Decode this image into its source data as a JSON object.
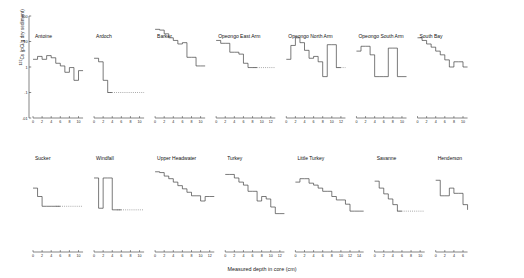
{
  "figure": {
    "xlabel": "Measured depth in core (cm)",
    "ylabel_prefix": "137",
    "ylabel_main": "Cs (pCi/g dry sediment)"
  },
  "chart_data": {
    "type": "line",
    "title": "",
    "xlabel": "Measured depth in core (cm)",
    "ylabel": "137Cs (pCi/g dry sediment)",
    "yscale": "log",
    "ylim": [
      0.01,
      100
    ],
    "yticks": [
      0.01,
      0.1,
      1,
      10,
      100
    ],
    "ytick_labels": [
      ".01",
      ".1",
      "1",
      "10",
      "100"
    ],
    "grid": false,
    "legend": "none",
    "line_style": "step-post",
    "dotted_means": "below detection limit",
    "panels": [
      {
        "name": "Antoine",
        "row": 0,
        "xlim": [
          0,
          11
        ],
        "xticks": [
          0,
          2,
          4,
          6,
          8,
          10
        ],
        "x": [
          0,
          1,
          2,
          3,
          4,
          5,
          6,
          7,
          8,
          9,
          10,
          11
        ],
        "y": [
          2.0,
          2.6,
          2.0,
          2.8,
          2.3,
          1.4,
          1.1,
          0.62,
          0.95,
          0.3,
          0.72,
          0.72
        ],
        "dotted_from": null
      },
      {
        "name": "Ardoch",
        "row": 0,
        "xlim": [
          0,
          11
        ],
        "xticks": [
          0,
          2,
          4,
          6,
          8,
          10
        ],
        "x": [
          0,
          1,
          2,
          3,
          4,
          5,
          6,
          7,
          8,
          9,
          10,
          11
        ],
        "y": [
          2.2,
          1.6,
          0.3,
          0.1,
          0.1,
          0.1,
          0.1,
          0.1,
          0.1,
          0.1,
          0.1,
          0.1
        ],
        "dotted_from": 3
      },
      {
        "name": "Barker",
        "row": 0,
        "xlim": [
          0,
          11
        ],
        "xticks": [
          0,
          2,
          4,
          6,
          8,
          10
        ],
        "x": [
          0,
          1,
          2,
          3,
          4,
          5,
          6,
          7,
          8,
          9,
          10
        ],
        "y": [
          30,
          28,
          20,
          14,
          11,
          8.0,
          9.0,
          2.4,
          2.4,
          1.1,
          1.1
        ],
        "dotted_from": null
      },
      {
        "name": "Opeongo East Arm",
        "row": 0,
        "xlim": [
          0,
          13
        ],
        "xticks": [
          0,
          2,
          4,
          6,
          8,
          10,
          12
        ],
        "x": [
          0,
          1,
          2,
          3,
          4,
          5,
          6,
          7,
          8,
          9,
          10,
          11,
          12
        ],
        "y": [
          11,
          8.5,
          8.5,
          3.8,
          3.8,
          3.2,
          1.4,
          0.95,
          0.95,
          0.95,
          0.95,
          0.95,
          0.95
        ],
        "dotted_from": 8
      },
      {
        "name": "Opeongo North Arm",
        "row": 0,
        "xlim": [
          0,
          13
        ],
        "xticks": [
          0,
          2,
          4,
          6,
          8,
          10,
          12
        ],
        "x": [
          0,
          1,
          2,
          3,
          4,
          5,
          6,
          7,
          8,
          9,
          10,
          11,
          12
        ],
        "y": [
          2.0,
          7.0,
          14,
          9.0,
          4.5,
          2.2,
          2.6,
          1.6,
          0.42,
          7.5,
          7.5,
          0.95,
          0.95
        ],
        "dotted_from": 11
      },
      {
        "name": "Opeongo South Arm",
        "row": 0,
        "xlim": [
          0,
          11
        ],
        "xticks": [
          0,
          2,
          4,
          6,
          8,
          10
        ],
        "x": [
          0,
          1,
          2,
          3,
          4,
          5,
          6,
          7,
          8,
          9,
          10
        ],
        "y": [
          4.2,
          6.5,
          6.5,
          3.0,
          0.42,
          0.42,
          0.42,
          5.5,
          5.5,
          0.42,
          0.42
        ],
        "dotted_from": null
      },
      {
        "name": "South Bay",
        "row": 0,
        "xlim": [
          0,
          11
        ],
        "xticks": [
          0,
          2,
          4,
          6,
          8,
          10
        ],
        "x": [
          0,
          1,
          2,
          3,
          4,
          5,
          6,
          7,
          8,
          9,
          10
        ],
        "y": [
          14,
          11,
          8.0,
          6.0,
          4.2,
          3.0,
          1.9,
          1.0,
          1.6,
          1.6,
          1.0
        ],
        "dotted_from": null
      },
      {
        "name": "Sucker",
        "row": 1,
        "xlim": [
          0,
          11
        ],
        "xticks": [
          0,
          2,
          4,
          6,
          8,
          10
        ],
        "x": [
          0,
          1,
          2,
          3,
          4,
          5,
          6,
          7,
          8,
          9,
          10
        ],
        "y": [
          3.2,
          1.5,
          0.62,
          0.62,
          0.62,
          0.62,
          0.62,
          0.62,
          0.62,
          0.62,
          0.62
        ],
        "dotted_from": 5
      },
      {
        "name": "Windfall",
        "row": 1,
        "xlim": [
          0,
          11
        ],
        "xticks": [
          0,
          2,
          4,
          6,
          8,
          10
        ],
        "x": [
          0,
          1,
          2,
          3,
          4,
          5,
          6,
          7,
          8,
          9,
          10
        ],
        "y": [
          8.0,
          0.52,
          8.0,
          8.0,
          0.45,
          0.45,
          0.45,
          0.45,
          0.45,
          0.45,
          0.45
        ],
        "dotted_from": 5
      },
      {
        "name": "Upper Headwater",
        "row": 1,
        "xlim": [
          0,
          13
        ],
        "xticks": [
          0,
          2,
          4,
          6,
          8,
          10,
          12
        ],
        "x": [
          0,
          1,
          2,
          3,
          4,
          5,
          6,
          7,
          8,
          9,
          10,
          11,
          12
        ],
        "y": [
          14,
          13,
          9.5,
          7.5,
          5.5,
          4.0,
          3.0,
          2.2,
          1.6,
          1.6,
          1.0,
          1.5,
          1.5
        ],
        "dotted_from": null
      },
      {
        "name": "Turkey",
        "row": 1,
        "xlim": [
          0,
          13
        ],
        "xticks": [
          0,
          2,
          4,
          6,
          8,
          10,
          12
        ],
        "x": [
          0,
          1,
          2,
          3,
          4,
          5,
          6,
          7,
          8,
          9,
          10,
          11,
          12
        ],
        "y": [
          11,
          11,
          8.0,
          5.5,
          4.2,
          2.4,
          2.4,
          1.0,
          1.5,
          1.2,
          0.58,
          0.32,
          0.32
        ],
        "dotted_from": null
      },
      {
        "name": "Little Turkey",
        "row": 1,
        "xlim": [
          0,
          15
        ],
        "xticks": [
          0,
          2,
          4,
          6,
          8,
          10,
          12,
          14
        ],
        "x": [
          0,
          1,
          2,
          3,
          4,
          5,
          6,
          7,
          8,
          9,
          10,
          11,
          12,
          13,
          14
        ],
        "y": [
          5.5,
          7.5,
          7.5,
          5.0,
          4.2,
          3.2,
          2.4,
          2.4,
          1.5,
          1.1,
          1.1,
          0.75,
          0.4,
          0.4,
          0.4
        ],
        "dotted_from": null
      },
      {
        "name": "Savanne",
        "row": 1,
        "xlim": [
          0,
          11
        ],
        "xticks": [
          0,
          2,
          4,
          6,
          8,
          10
        ],
        "x": [
          0,
          1,
          2,
          3,
          4,
          5,
          6,
          7,
          8,
          9,
          10
        ],
        "y": [
          6.0,
          3.2,
          1.9,
          1.2,
          0.72,
          0.4,
          0.4,
          0.4,
          0.4,
          0.4,
          0.4
        ],
        "dotted_from": 5
      },
      {
        "name": "Henderson",
        "row": 1,
        "xlim": [
          0,
          7
        ],
        "xticks": [
          0,
          2,
          4,
          6
        ],
        "x": [
          0,
          1,
          2,
          3,
          4,
          5,
          6,
          7
        ],
        "y": [
          6.5,
          1.6,
          1.6,
          3.2,
          2.0,
          2.0,
          0.72,
          0.45
        ],
        "dotted_from": null
      }
    ]
  }
}
